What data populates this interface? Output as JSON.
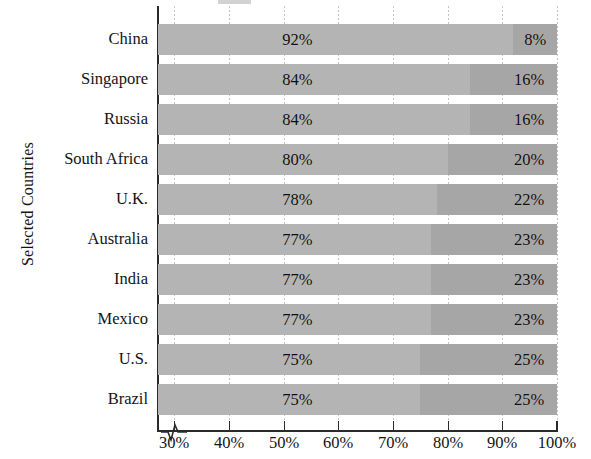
{
  "chart_data": {
    "type": "bar",
    "subtype": "stacked-horizontal-100",
    "title": "",
    "xlabel": "",
    "ylabel": "Selected Countries",
    "categories": [
      "China",
      "Singapore",
      "Russia",
      "South Africa",
      "U.K.",
      "Australia",
      "India",
      "Mexico",
      "U.S.",
      "Brazil"
    ],
    "series": [
      {
        "name": "Segment 1",
        "color": "#b4b4b4",
        "values": [
          92,
          84,
          84,
          80,
          78,
          77,
          77,
          77,
          75,
          75
        ],
        "labels": [
          "92%",
          "84%",
          "84%",
          "80%",
          "78%",
          "77%",
          "77%",
          "77%",
          "75%",
          "75%"
        ]
      },
      {
        "name": "Segment 2",
        "color": "#a6a6a6",
        "values": [
          8,
          16,
          16,
          20,
          22,
          23,
          23,
          23,
          25,
          25
        ],
        "labels": [
          "8%",
          "16%",
          "16%",
          "20%",
          "22%",
          "23%",
          "23%",
          "23%",
          "25%",
          "25%"
        ]
      }
    ],
    "xlim": [
      27,
      100
    ],
    "axis_break": true,
    "xticks": [
      30,
      40,
      50,
      60,
      70,
      80,
      90,
      100
    ],
    "xtick_labels": [
      "30%",
      "40%",
      "50%",
      "60%",
      "70%",
      "80%",
      "90%",
      "100%"
    ],
    "grid": true,
    "grid_axis": "x",
    "grid_style": "dotted",
    "legend": "cut-off-above-plot"
  },
  "axis": {
    "y_title": "Selected Countries"
  },
  "colors": {
    "segment_1": "#b4b4b4",
    "segment_2": "#a6a6a6",
    "axis": "#2a2a2a",
    "grid": "#b9b9b9",
    "text": "#141414",
    "background": "#ffffff"
  }
}
